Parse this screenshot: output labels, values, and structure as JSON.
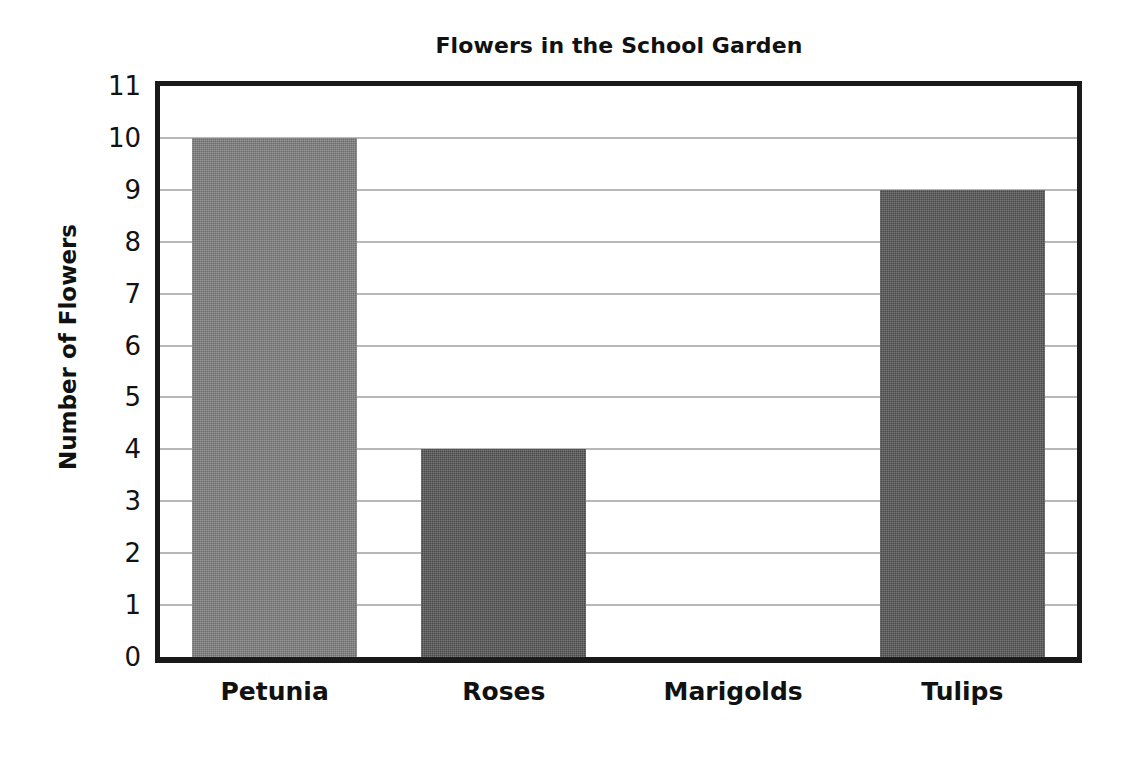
{
  "chart_data": {
    "type": "bar",
    "title": "Flowers in the School Garden",
    "xlabel": "",
    "ylabel": "Number of Flowers",
    "categories": [
      "Petunia",
      "Roses",
      "Marigolds",
      "Tulips"
    ],
    "values": [
      10,
      4,
      0,
      9
    ],
    "ylim": [
      0,
      11
    ],
    "ytick_labels": [
      "11",
      "10",
      "9",
      "8",
      "7",
      "6",
      "5",
      "4",
      "3",
      "2",
      "1",
      "0"
    ],
    "ytick_values": [
      11,
      10,
      9,
      8,
      7,
      6,
      5,
      4,
      3,
      2,
      1,
      0
    ],
    "grid": true,
    "gridline_values": [
      10,
      9,
      8,
      7,
      6,
      5,
      4,
      3,
      2,
      1
    ],
    "legend": null,
    "legend_position": "none",
    "bar_colors": [
      "#7d7d7d",
      "#555555",
      "#555555",
      "#555555"
    ],
    "colors": {
      "axis": "#1a1a1a",
      "gridline": "#b4b4b4",
      "text": "#111111",
      "background": "#ffffff",
      "bar_light_gray": "#7d7d7d",
      "bar_dark_gray": "#555555"
    }
  },
  "title": {
    "text": "Flowers in the School Garden"
  },
  "axes": {
    "y_title": "Number of Flowers"
  },
  "y_ticks": [
    {
      "label": "11"
    },
    {
      "label": "10"
    },
    {
      "label": "9"
    },
    {
      "label": "8"
    },
    {
      "label": "7"
    },
    {
      "label": "6"
    },
    {
      "label": "5"
    },
    {
      "label": "4"
    },
    {
      "label": "3"
    },
    {
      "label": "2"
    },
    {
      "label": "1"
    },
    {
      "label": "0"
    }
  ],
  "bars": [
    {
      "label": "Petunia",
      "value": 10,
      "color": "#7d7d7d"
    },
    {
      "label": "Roses",
      "value": 4,
      "color": "#555555"
    },
    {
      "label": "Marigolds",
      "value": 0,
      "color": "#555555"
    },
    {
      "label": "Tulips",
      "value": 9,
      "color": "#555555"
    }
  ]
}
